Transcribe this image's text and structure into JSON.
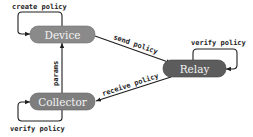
{
  "diagram": {
    "nodes": {
      "device": {
        "label": "Device",
        "color": "#8a8a8a"
      },
      "relay": {
        "label": "Relay",
        "color": "#5c5c5c"
      },
      "collector": {
        "label": "Collector",
        "color": "#7e7e7e"
      }
    },
    "edges": {
      "device_self": {
        "label": "create policy",
        "from": "Device",
        "to": "Device"
      },
      "device_to_relay": {
        "label": "send policy",
        "from": "Device",
        "to": "Relay"
      },
      "relay_self": {
        "label": "verify policy",
        "from": "Relay",
        "to": "Relay"
      },
      "relay_to_collector": {
        "label": "receive policy",
        "from": "Relay",
        "to": "Collector"
      },
      "collector_to_device": {
        "label": "params",
        "from": "Collector",
        "to": "Device"
      },
      "collector_self": {
        "label": "verify policy",
        "from": "Collector",
        "to": "Collector"
      }
    },
    "edge_color": "#1e1e1e"
  }
}
